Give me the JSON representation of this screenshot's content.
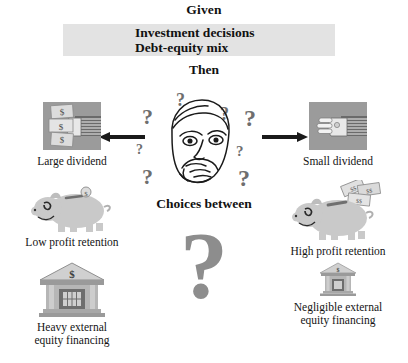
{
  "header": {
    "given_label": "Given",
    "given_items": [
      "Investment decisions",
      "Debt-equity mix"
    ],
    "then_label": "Then"
  },
  "center": {
    "choices_label": "Choices between",
    "big_question_mark": "?",
    "thinker_icon": "thinking-face-icon",
    "question_marks": [
      "?",
      "?",
      "?",
      "?",
      "?",
      "?",
      "?",
      "?"
    ]
  },
  "arrows": {
    "left_arrow": "arrow-left-icon",
    "right_arrow": "arrow-right-icon"
  },
  "nodes": {
    "left": [
      {
        "id": "large-dividend",
        "icon": "hand-holding-cash-icon",
        "caption": "Large dividend"
      },
      {
        "id": "low-profit-retention",
        "icon": "piggy-bank-empty-icon",
        "caption": "Low profit retention"
      },
      {
        "id": "heavy-external-equity-financing",
        "icon": "bank-building-large-icon",
        "caption": "Heavy external\nequity financing"
      }
    ],
    "right": [
      {
        "id": "small-dividend",
        "icon": "hand-empty-icon",
        "caption": "Small dividend"
      },
      {
        "id": "high-profit-retention",
        "icon": "piggy-bank-full-icon",
        "caption": "High profit retention"
      },
      {
        "id": "negligible-external-equity-financing",
        "icon": "bank-building-small-icon",
        "caption": "Negligible external\nequity financing"
      }
    ]
  },
  "colors": {
    "band_gray": "#e3e3e3",
    "art_gray": "#b4b4b4",
    "art_dark_gray": "#8d8d8d",
    "ink": "#141414",
    "qmark_gray": "#8d8d8d"
  }
}
